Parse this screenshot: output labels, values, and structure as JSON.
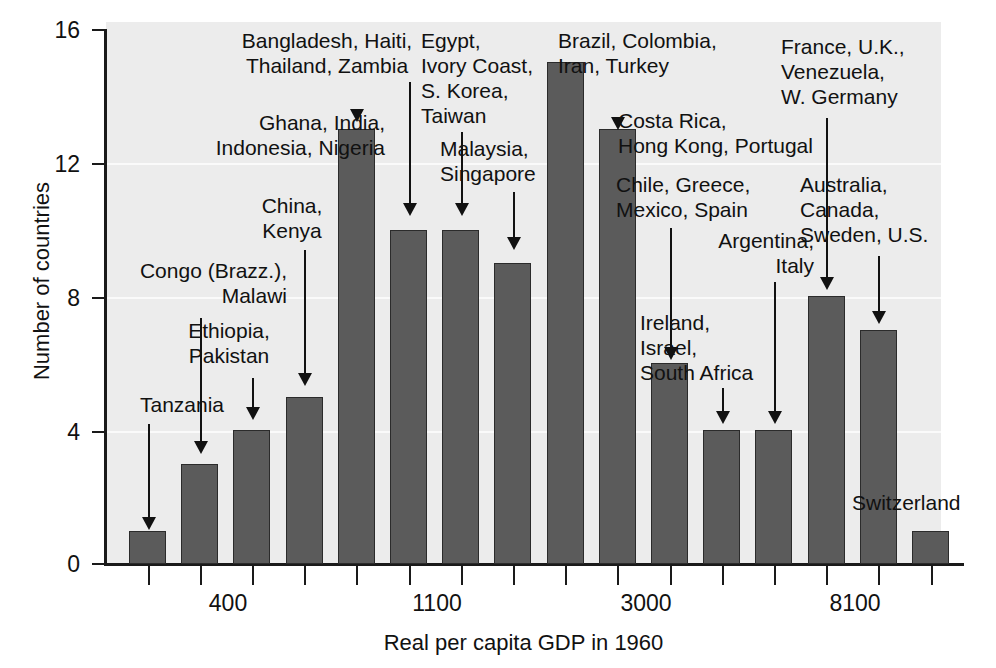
{
  "chart_data": {
    "type": "bar",
    "title": "",
    "xlabel": "Real per capita GDP in 1960",
    "ylabel": "Number of countries",
    "ylim": [
      0,
      16
    ],
    "yticks": [
      0,
      4,
      8,
      12,
      16
    ],
    "ytick_labels": [
      "0",
      "4",
      "8",
      "12",
      "16"
    ],
    "xtick_labels": [
      "400",
      "1100",
      "3000",
      "8100"
    ],
    "grid": true,
    "legend": "none",
    "bin_count": 16,
    "values": [
      1,
      3,
      4,
      5,
      13,
      10,
      10,
      9,
      15,
      13,
      6,
      4,
      4,
      8,
      7,
      1
    ],
    "categories": [
      "bin-1",
      "bin-2",
      "bin-3",
      "bin-4",
      "bin-5",
      "bin-6",
      "bin-7",
      "bin-8",
      "bin-9",
      "bin-10",
      "bin-11",
      "bin-12",
      "bin-13",
      "bin-14",
      "bin-15",
      "bin-16"
    ],
    "bar_color": "#5b5b5b",
    "plot_background": "#ececec",
    "annotations": [
      {
        "id": "tanzania",
        "text": "Tanzania",
        "bar_index": 0,
        "value": 1
      },
      {
        "id": "congo-malawi",
        "text": "Congo (Brazz.),\nMalawi",
        "bar_index": 1,
        "value": 3
      },
      {
        "id": "ethiopia-pak",
        "text": "Ethiopia,\nPakistan",
        "bar_index": 2,
        "value": 4
      },
      {
        "id": "china-kenya",
        "text": "China,\nKenya",
        "bar_index": 3,
        "value": 5
      },
      {
        "id": "ghana-india",
        "text": "Ghana, India,\nIndonesia, Nigeria",
        "bar_index": 4,
        "value": 13
      },
      {
        "id": "bangladesh",
        "text": "Bangladesh, Haiti,\nThailand, Zambia",
        "bar_index": 5,
        "value": 10
      },
      {
        "id": "egypt",
        "text": "Egypt,\nIvory Coast,\nS. Korea,\nTaiwan",
        "bar_index": 6,
        "value": 10
      },
      {
        "id": "malaysia",
        "text": "Malaysia,\nSingapore",
        "bar_index": 7,
        "value": 9
      },
      {
        "id": "brazil",
        "text": "Brazil, Colombia,\nIran, Turkey",
        "bar_index": 8,
        "value": 15
      },
      {
        "id": "costa-rica",
        "text": "Costa Rica,\nHong Kong, Portugal",
        "bar_index": 9,
        "value": 13
      },
      {
        "id": "chile-greece",
        "text": "Chile, Greece,\nMexico, Spain",
        "bar_index": 10,
        "value": 6
      },
      {
        "id": "ireland",
        "text": "Ireland,\nIsrael,\nSouth Africa",
        "bar_index": 11,
        "value": 4
      },
      {
        "id": "argentina",
        "text": "Argentina,\nItaly",
        "bar_index": 12,
        "value": 4
      },
      {
        "id": "france-uk",
        "text": "France, U.K.,\nVenezuela,\nW. Germany",
        "bar_index": 13,
        "value": 8
      },
      {
        "id": "australia",
        "text": "Australia,\nCanada,\nSweden, U.S.",
        "bar_index": 14,
        "value": 7
      },
      {
        "id": "switzerland",
        "text": "Switzerland",
        "bar_index": 15,
        "value": 1
      }
    ]
  },
  "axes": {
    "y_title": "Number of countries",
    "x_title": "Real per capita GDP in 1960",
    "y_ticks": [
      {
        "label": "16"
      },
      {
        "label": "12"
      },
      {
        "label": "8"
      },
      {
        "label": "4"
      },
      {
        "label": "0"
      }
    ],
    "x_ticks": [
      {
        "label": "400"
      },
      {
        "label": "1100"
      },
      {
        "label": "3000"
      },
      {
        "label": "8100"
      }
    ]
  },
  "annotation_text": {
    "tanzania": "Tanzania",
    "congo_malawi": "Congo (Brazz.),\nMalawi",
    "ethiopia_pakistan": "Ethiopia,\nPakistan",
    "china_kenya": "China,\nKenya",
    "ghana_india": "Ghana, India,\nIndonesia, Nigeria",
    "bangladesh_haiti": "Bangladesh, Haiti,\nThailand, Zambia",
    "egypt_ivory": "Egypt,\nIvory Coast,\nS. Korea,\nTaiwan",
    "malaysia_singapore": "Malaysia,\nSingapore",
    "brazil_colombia": "Brazil, Colombia,\nIran, Turkey",
    "costa_rica": "Costa Rica,\nHong Kong, Portugal",
    "chile_greece": "Chile, Greece,\nMexico, Spain",
    "ireland_israel": "Ireland,\nIsrael,\nSouth Africa",
    "argentina_italy": "Argentina,\nItaly",
    "france_uk": "France, U.K.,\nVenezuela,\nW. Germany",
    "australia_canada": "Australia,\nCanada,\nSweden, U.S.",
    "switzerland": "Switzerland"
  }
}
